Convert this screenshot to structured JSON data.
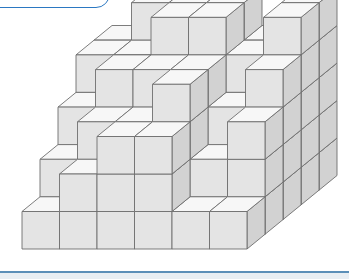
{
  "figure": {
    "type": "cube-stack",
    "colors": {
      "front": "#e4e4e4",
      "top": "#f7f7f7",
      "side": "#d2d2d2",
      "edge": "#6e6e6e",
      "accent": "#1f6fc0"
    },
    "projection": {
      "origin_x": 22,
      "origin_y": 249,
      "unit": 37.5,
      "depth_dx": 18,
      "depth_dy": -14.7
    },
    "heightmap_front_to_back": [
      [
        1,
        2,
        3,
        3,
        1,
        1
      ],
      [
        2,
        3,
        3,
        4,
        2,
        3
      ],
      [
        3,
        4,
        4,
        4,
        3,
        4
      ],
      [
        4,
        4,
        5,
        5,
        4,
        5
      ],
      [
        4,
        5,
        5,
        5,
        4,
        5
      ]
    ]
  }
}
